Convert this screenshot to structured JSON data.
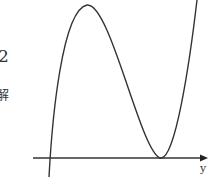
{
  "side_text": {
    "number": "2",
    "character": "解"
  },
  "axis": {
    "x_label": "y"
  },
  "diagram": {
    "type": "cubic-function-graph",
    "stroke_color": "#333333"
  }
}
